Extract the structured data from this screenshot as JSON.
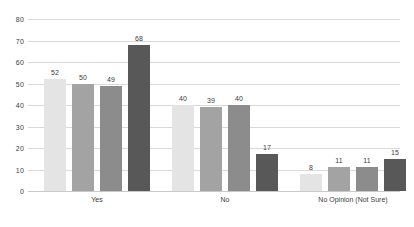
{
  "chart_data": {
    "type": "bar",
    "title": "",
    "subtitle": "",
    "xlabel": "",
    "ylabel": "",
    "ylim": [
      0,
      80
    ],
    "ytick_step": 10,
    "yticks": [
      "80",
      "70",
      "60",
      "50",
      "40",
      "30",
      "20",
      "10",
      "0"
    ],
    "grid": true,
    "legend": "none",
    "categories": [
      "Yes",
      "No",
      "No Opinion (Not Sure)"
    ],
    "series": [
      {
        "name": "Series 1",
        "color": "#e4e4e4",
        "values": [
          52,
          40,
          8
        ]
      },
      {
        "name": "Series 2",
        "color": "#a3a3a3",
        "values": [
          50,
          39,
          11
        ]
      },
      {
        "name": "Series 3",
        "color": "#8c8c8c",
        "values": [
          49,
          40,
          11
        ]
      },
      {
        "name": "Series 4",
        "color": "#585858",
        "values": [
          68,
          17,
          15
        ]
      }
    ],
    "bar_labels": [
      [
        "52",
        "50",
        "49",
        "68"
      ],
      [
        "40",
        "39",
        "40",
        "17"
      ],
      [
        "8",
        "11",
        "11",
        "15"
      ]
    ],
    "colors": {
      "background": "#ffffff",
      "gridline": "#d9d9d9",
      "baseline": "#c9c9c9",
      "text": "#3c3c3c"
    }
  }
}
